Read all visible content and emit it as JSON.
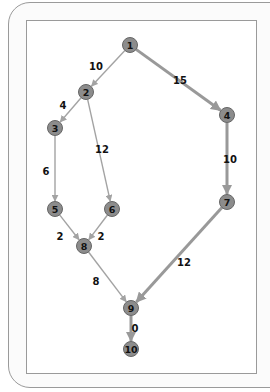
{
  "diagram": {
    "type": "directed-graph",
    "colors": {
      "node_fill": "#8c8c8c",
      "node_stroke": "#666666",
      "edge": "#a3a3a3",
      "critical_edge": "#999999",
      "text": "#111111"
    },
    "nodes": [
      {
        "id": "1",
        "label": "1",
        "x": 130,
        "y": 45
      },
      {
        "id": "2",
        "label": "2",
        "x": 86,
        "y": 92
      },
      {
        "id": "3",
        "label": "3",
        "x": 55,
        "y": 128
      },
      {
        "id": "4",
        "label": "4",
        "x": 227,
        "y": 115
      },
      {
        "id": "5",
        "label": "5",
        "x": 55,
        "y": 209
      },
      {
        "id": "6",
        "label": "6",
        "x": 112,
        "y": 209
      },
      {
        "id": "7",
        "label": "7",
        "x": 227,
        "y": 202
      },
      {
        "id": "8",
        "label": "8",
        "x": 84,
        "y": 246
      },
      {
        "id": "9",
        "label": "9",
        "x": 131,
        "y": 308
      },
      {
        "id": "10",
        "label": "10",
        "x": 131,
        "y": 349
      }
    ],
    "edges": [
      {
        "from": "1",
        "to": "2",
        "weight": "10",
        "critical": false,
        "lx": 96,
        "ly": 66
      },
      {
        "from": "1",
        "to": "4",
        "weight": "15",
        "critical": true,
        "lx": 180,
        "ly": 80
      },
      {
        "from": "2",
        "to": "3",
        "weight": "4",
        "critical": false,
        "lx": 63,
        "ly": 105
      },
      {
        "from": "2",
        "to": "6",
        "weight": "12",
        "critical": false,
        "lx": 102,
        "ly": 149
      },
      {
        "from": "3",
        "to": "5",
        "weight": "6",
        "critical": false,
        "lx": 46,
        "ly": 171
      },
      {
        "from": "4",
        "to": "7",
        "weight": "10",
        "critical": true,
        "lx": 230,
        "ly": 159
      },
      {
        "from": "5",
        "to": "8",
        "weight": "2",
        "critical": false,
        "lx": 60,
        "ly": 236
      },
      {
        "from": "6",
        "to": "8",
        "weight": "2",
        "critical": false,
        "lx": 101,
        "ly": 236
      },
      {
        "from": "8",
        "to": "9",
        "weight": "8",
        "critical": false,
        "lx": 96,
        "ly": 281
      },
      {
        "from": "7",
        "to": "9",
        "weight": "12",
        "critical": true,
        "lx": 184,
        "ly": 262
      },
      {
        "from": "9",
        "to": "10",
        "weight": "0",
        "critical": true,
        "lx": 135,
        "ly": 328
      }
    ]
  }
}
